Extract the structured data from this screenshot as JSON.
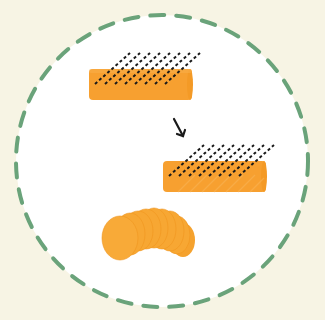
{
  "figure": {
    "colors": {
      "background": "#f7f4e4",
      "circle_fill": "#ffffff",
      "circle_dash": "#6aa37a",
      "food": "#f7a030",
      "food_shadow": "#f09a25",
      "cut_lines": "#1a1a1a",
      "arrow": "#1a1a1a"
    },
    "steps": [
      {
        "name": "whole-cylinder",
        "label": "whole"
      },
      {
        "name": "cut-cylinder",
        "label": "cut diagonally"
      },
      {
        "name": "fanned-slices",
        "label": "sliced"
      }
    ],
    "caption": ""
  }
}
